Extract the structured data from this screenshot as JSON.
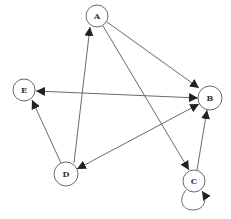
{
  "diagram": {
    "type": "directed-graph",
    "colors": {
      "stroke": "#6a6a6a",
      "node_fill": "#ffffff",
      "label": "#333333"
    },
    "nodes": [
      {
        "id": "A",
        "label": "A",
        "x": 97,
        "y": 16
      },
      {
        "id": "B",
        "label": "B",
        "x": 210,
        "y": 98
      },
      {
        "id": "C",
        "label": "C",
        "x": 194,
        "y": 181
      },
      {
        "id": "D",
        "label": "D",
        "x": 66,
        "y": 174
      },
      {
        "id": "E",
        "label": "E",
        "x": 24,
        "y": 90
      }
    ],
    "edges": [
      {
        "from": "A",
        "to": "B",
        "bidirectional": false
      },
      {
        "from": "A",
        "to": "C",
        "bidirectional": false
      },
      {
        "from": "D",
        "to": "A",
        "bidirectional": false
      },
      {
        "from": "D",
        "to": "E",
        "bidirectional": false
      },
      {
        "from": "E",
        "to": "B",
        "bidirectional": true
      },
      {
        "from": "B",
        "to": "D",
        "bidirectional": true
      },
      {
        "from": "C",
        "to": "B",
        "bidirectional": false
      },
      {
        "from": "C",
        "to": "C",
        "self_loop": true
      }
    ]
  }
}
